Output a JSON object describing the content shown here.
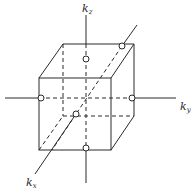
{
  "diagram": {
    "type": "reciprocal-space cube with axes",
    "axes": [
      {
        "name": "kz",
        "base": "k",
        "subscript": "z"
      },
      {
        "name": "ky",
        "base": "k",
        "subscript": "y"
      },
      {
        "name": "kx",
        "base": "k",
        "subscript": "x"
      }
    ],
    "labels": {
      "kz_base": "k",
      "kz_sub": "z",
      "ky_base": "k",
      "ky_sub": "y",
      "kx_base": "k",
      "kx_sub": "x"
    },
    "points_count": 6,
    "colors": {
      "stroke": "#2a2a2a",
      "background": "#ffffff"
    }
  }
}
